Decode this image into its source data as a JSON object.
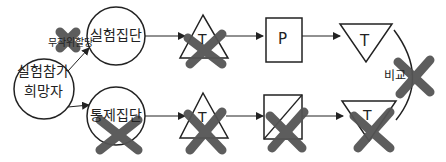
{
  "diagram": {
    "start_node": {
      "line1": "실험참가",
      "line2": "희망자"
    },
    "assignment_label": "무작위할당",
    "experimental_group": "실험집단",
    "control_group": "통제집단",
    "pretest_symbol": "T",
    "treatment_symbol": "P",
    "posttest_symbol": "T",
    "compare_label": "비교",
    "cross_mark_color": "#555555",
    "line_color": "#222222"
  }
}
